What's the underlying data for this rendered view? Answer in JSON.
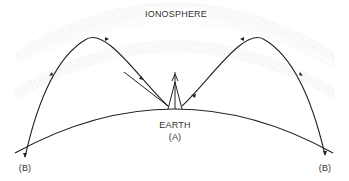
{
  "diagram": {
    "labels": {
      "ionosphere": "IONOSPHERE",
      "earth": "EARTH",
      "transmitter": "(A)",
      "receiver_left": "(B)",
      "receiver_right": "(B)"
    },
    "colors": {
      "line": "#222222",
      "ionosphere_dots": "#9a9a9a",
      "text": "#333333",
      "background": "#ffffff"
    },
    "nodes": [
      {
        "id": "A",
        "label": "(A)",
        "role": "transmitter antenna on earth"
      },
      {
        "id": "B_left",
        "label": "(B)",
        "role": "receiver left"
      },
      {
        "id": "B_right",
        "label": "(B)",
        "role": "receiver right"
      },
      {
        "id": "ionosphere",
        "label": "IONOSPHERE",
        "role": "reflecting layer (two dotted bands)"
      },
      {
        "id": "earth",
        "label": "EARTH",
        "role": "curved ground surface"
      }
    ],
    "edges": [
      {
        "from": "A",
        "to": "ionosphere",
        "to2": "B_left",
        "type": "arrowed ray reflected"
      },
      {
        "from": "A",
        "to": "ionosphere",
        "to2": "B_right",
        "type": "arrowed ray reflected"
      }
    ]
  }
}
